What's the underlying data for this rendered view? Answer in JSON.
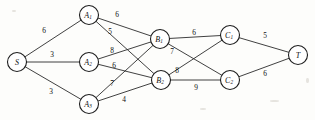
{
  "diagram": {
    "type": "network-flow-graph",
    "title": "",
    "canvas": {
      "width": 315,
      "height": 120
    },
    "node_radius": 9.5,
    "colors": {
      "node_stroke": "#1d1d1d",
      "edge_stroke": "#2b2b2b",
      "background": "#fdfdfb",
      "text": "#101010"
    },
    "nodes": [
      {
        "id": "S",
        "base": "S",
        "sub": "",
        "x": 17,
        "y": 62
      },
      {
        "id": "A1",
        "base": "A",
        "sub": "1",
        "x": 89,
        "y": 15
      },
      {
        "id": "A2",
        "base": "A",
        "sub": "2",
        "x": 89,
        "y": 62
      },
      {
        "id": "A3",
        "base": "A",
        "sub": "3",
        "x": 89,
        "y": 104
      },
      {
        "id": "B1",
        "base": "B",
        "sub": "1",
        "x": 160,
        "y": 39
      },
      {
        "id": "B2",
        "base": "B",
        "sub": "2",
        "x": 161,
        "y": 80
      },
      {
        "id": "C1",
        "base": "C",
        "sub": "1",
        "x": 230,
        "y": 35
      },
      {
        "id": "C2",
        "base": "C",
        "sub": "2",
        "x": 230,
        "y": 80
      },
      {
        "id": "T",
        "base": "T",
        "sub": "",
        "x": 298,
        "y": 55
      }
    ],
    "edges": [
      {
        "from": "S",
        "to": "A1",
        "weight": "6",
        "lx": 44,
        "ly": 30
      },
      {
        "from": "S",
        "to": "A2",
        "weight": "3",
        "lx": 52,
        "ly": 54
      },
      {
        "from": "S",
        "to": "A3",
        "weight": "3",
        "lx": 51,
        "ly": 91
      },
      {
        "from": "A1",
        "to": "B1",
        "weight": "6",
        "lx": 117,
        "ly": 14
      },
      {
        "from": "A1",
        "to": "B2",
        "weight": "5",
        "lx": 110,
        "ly": 31
      },
      {
        "from": "A2",
        "to": "B1",
        "weight": "8",
        "lx": 112,
        "ly": 50
      },
      {
        "from": "A2",
        "to": "B2",
        "weight": "6",
        "lx": 114,
        "ly": 65
      },
      {
        "from": "A3",
        "to": "B1",
        "weight": "7",
        "lx": 112,
        "ly": 83
      },
      {
        "from": "A3",
        "to": "B2",
        "weight": "4",
        "lx": 124,
        "ly": 99
      },
      {
        "from": "B1",
        "to": "C1",
        "weight": "6",
        "lx": 194,
        "ly": 32
      },
      {
        "from": "B1",
        "to": "C2",
        "weight": "7",
        "lx": 172,
        "ly": 51
      },
      {
        "from": "B2",
        "to": "C1",
        "weight": "8",
        "lx": 177,
        "ly": 70
      },
      {
        "from": "B2",
        "to": "C2",
        "weight": "9",
        "lx": 196,
        "ly": 87
      },
      {
        "from": "C1",
        "to": "T",
        "weight": "5",
        "lx": 265,
        "ly": 35
      },
      {
        "from": "C2",
        "to": "T",
        "weight": "6",
        "lx": 265,
        "ly": 73
      }
    ]
  }
}
